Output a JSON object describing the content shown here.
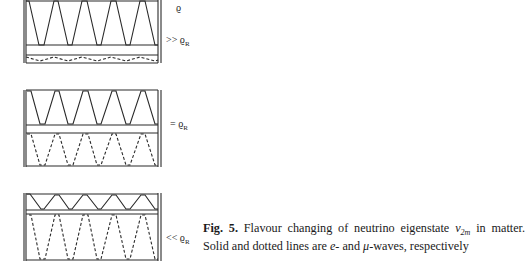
{
  "figure": {
    "panels": [
      {
        "id": "top",
        "label_rho": "ϱ",
        "label_condition": ">> ϱ",
        "label_sub": "R",
        "e_wave": {
          "style": "solid",
          "cycles": 5,
          "amplitude": "large"
        },
        "mu_wave": {
          "style": "dashed",
          "cycles": 5,
          "amplitude": "small"
        }
      },
      {
        "id": "middle",
        "label_condition": "= ϱ",
        "label_sub": "R",
        "e_wave": {
          "style": "solid",
          "cycles": 5,
          "amplitude": "full"
        },
        "mu_wave": {
          "style": "dashed",
          "cycles": 5,
          "amplitude": "full"
        }
      },
      {
        "id": "bottom",
        "label_condition": "<< ϱ",
        "label_sub": "R",
        "e_wave": {
          "style": "solid",
          "cycles": 5,
          "amplitude": "small"
        },
        "mu_wave": {
          "style": "dashed",
          "cycles": 5,
          "amplitude": "large"
        }
      }
    ],
    "caption": {
      "fig_label": "Fig. 5.",
      "text_1": " Flavour changing of neutrino eigenstate ",
      "nu": "ν",
      "nu_sub": "2m",
      "text_2": " in matter. Solid and dotted lines are ",
      "e": "e",
      "text_3": "- and ",
      "mu": "μ",
      "text_4": "-waves, respectively"
    }
  }
}
